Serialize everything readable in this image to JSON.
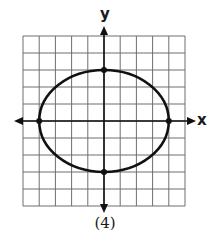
{
  "chart_data": {
    "type": "line",
    "title": "",
    "caption": "(4)",
    "xlabel": "x",
    "ylabel": "y",
    "xlim": [
      -5,
      5
    ],
    "ylim": [
      -5,
      5
    ],
    "grid": true,
    "grid_step": 1,
    "tick_labels": false,
    "series": [
      {
        "name": "ellipse",
        "shape": "ellipse",
        "center": [
          0,
          0
        ],
        "semi_axis_x": 4,
        "semi_axis_y": 3,
        "equation": "x^2/16 + y^2/9 = 1",
        "marked_points": [
          [
            -4,
            0
          ],
          [
            4,
            0
          ],
          [
            0,
            3
          ],
          [
            0,
            -3
          ]
        ]
      }
    ],
    "colors": {
      "curve": "#111111",
      "grid": "#6e6e6e",
      "axis": "#111111"
    }
  }
}
